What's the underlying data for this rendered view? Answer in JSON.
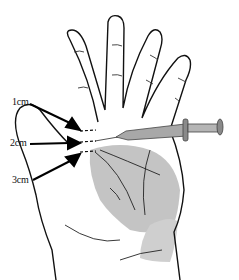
{
  "figure": {
    "labels": [
      {
        "text": "1cm",
        "x": 12,
        "y": 127
      },
      {
        "text": "2cm",
        "x": 10,
        "y": 148
      },
      {
        "text": "3cm",
        "x": 12,
        "y": 182
      }
    ],
    "colors": {
      "line": "#111111",
      "shade": "#bdbdbd",
      "syringe": "#9a9a9a"
    }
  }
}
